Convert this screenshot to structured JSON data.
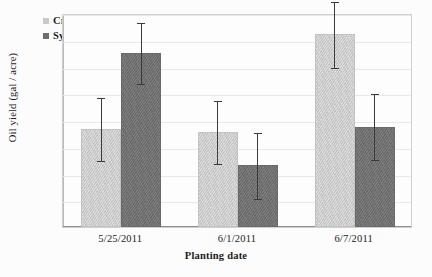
{
  "chart_data": {
    "type": "bar",
    "title": "",
    "xlabel": "Planting date",
    "ylabel": "Oil yield (gal / acre)",
    "categories": [
      "5/25/2011",
      "6/1/2011",
      "6/7/2011"
    ],
    "ylim": [
      0,
      80
    ],
    "yticks": [
      0,
      10,
      20,
      30,
      40,
      50,
      60,
      70,
      80
    ],
    "grid": true,
    "legend_position": "top-left",
    "series": [
      {
        "name": "Croplan 306",
        "color": "#c9c9c9",
        "values": [
          36.5,
          35.5,
          72.0
        ],
        "errors": [
          12.0,
          12.0,
          12.5
        ]
      },
      {
        "name": "Syngenta 7120",
        "color": "#6f6f6f",
        "values": [
          65.0,
          23.0,
          37.5
        ],
        "errors": [
          11.5,
          12.5,
          12.5
        ]
      }
    ]
  }
}
